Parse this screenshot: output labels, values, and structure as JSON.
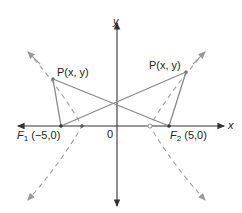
{
  "diagram": {
    "colors": {
      "axis": "#333333",
      "segment": "#8a8a8a",
      "curve": "#a0a0a0",
      "text": "#222222"
    },
    "axes": {
      "x_label": "x",
      "y_label": "y",
      "origin_label": "0"
    },
    "foci": [
      {
        "name": "F",
        "subscript": "1",
        "coords": "(−5,0)"
      },
      {
        "name": "F",
        "subscript": "2",
        "coords": "(5,0)"
      }
    ],
    "points": [
      {
        "label": "P(x, y)",
        "side": "left"
      },
      {
        "label": "P(x, y)",
        "side": "right"
      }
    ],
    "curves": [
      {
        "name": "left-branch",
        "style": "dashed"
      },
      {
        "name": "right-branch",
        "style": "dashed"
      }
    ]
  }
}
